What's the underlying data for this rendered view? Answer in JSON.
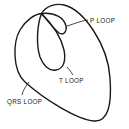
{
  "diagram": {
    "labels": {
      "p_loop": "P LOOP",
      "t_loop": "T LOOP",
      "qrs_loop": "QRS LOOP"
    },
    "stroke_color": "#1a1a1a",
    "background_color": "#ffffff"
  }
}
